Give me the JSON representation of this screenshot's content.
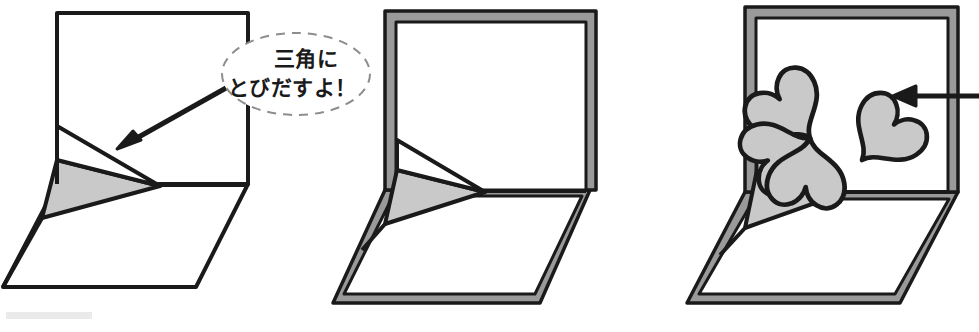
{
  "figure": {
    "background_color": "#ffffff",
    "ink_color": "#1a1a1a",
    "fill_gray": "#c9c9c9",
    "frame_gray": "#9a9a9a",
    "bubble_border_color": "#8d8d8d"
  },
  "callout": {
    "line1": "三角に",
    "line2": "とびだすよ！",
    "shape": "ellipse-dashed"
  },
  "panels": [
    {
      "id": "panel-1",
      "label": "step-1-plain-card-with-triangle-popup",
      "has_frame": false,
      "has_clover": false,
      "has_callout": true,
      "has_arrow": true
    },
    {
      "id": "panel-2",
      "label": "step-2-card-with-gray-border-frame",
      "has_frame": true,
      "has_clover": false,
      "has_callout": false,
      "has_arrow": false
    },
    {
      "id": "panel-3",
      "label": "step-3-finished-card-with-heart-clover",
      "has_frame": true,
      "has_clover": true,
      "has_callout": false,
      "has_arrow": true
    }
  ],
  "clover": {
    "petal_count": 4,
    "petal_shape": "heart",
    "center_x": 810,
    "center_y": 138
  },
  "scan_artifact": {
    "present": true,
    "x": 6,
    "y": 312,
    "width": 86,
    "height": 8
  }
}
